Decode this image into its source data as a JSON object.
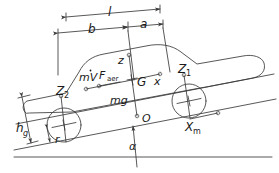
{
  "diagram": {
    "background_color": "#ffffff",
    "line_color": "#3a3a3a",
    "text_color": "#1a1a1a",
    "incline_angle_deg": 11
  },
  "labels": {
    "length_total": "l",
    "dist_rear": "b",
    "dist_front": "a",
    "height_cg": "h",
    "height_cg_sub": "g",
    "wheel_radius": "r",
    "inertia_force": "mV",
    "aero_force": "F",
    "aero_force_sub": "aer",
    "axis_z": "z",
    "axis_x": "x",
    "cg_point": "G",
    "origin_point": "O",
    "weight": "mg",
    "normal_front": "Z",
    "normal_front_sub": "1",
    "normal_rear": "Z",
    "normal_rear_sub": "2",
    "axis_xm": "X",
    "axis_xm_sub": "m",
    "angle": "α"
  }
}
